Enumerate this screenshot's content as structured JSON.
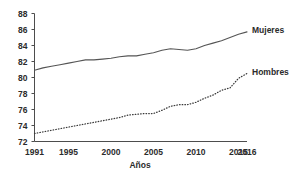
{
  "chart_data": {
    "type": "line",
    "title": "",
    "subtitle": "",
    "xlabel": "Años",
    "ylabel": "",
    "xlim": [
      1991,
      2016
    ],
    "ylim": [
      72,
      88
    ],
    "grid": false,
    "legend_position": "right-inline",
    "x_tick_labels": [
      "1991",
      "1995",
      "2000",
      "2005",
      "2010",
      "2015",
      "2016"
    ],
    "x_tick_values": [
      1991,
      1995,
      2000,
      2005,
      2010,
      2015,
      2016
    ],
    "y_tick_labels": [
      "72",
      "74",
      "76",
      "78",
      "80",
      "82",
      "84",
      "86",
      "88"
    ],
    "y_tick_values": [
      72,
      74,
      76,
      78,
      80,
      82,
      84,
      86,
      88
    ],
    "x": [
      1991,
      1992,
      1993,
      1994,
      1995,
      1996,
      1997,
      1998,
      1999,
      2000,
      2001,
      2002,
      2003,
      2004,
      2005,
      2006,
      2007,
      2008,
      2009,
      2010,
      2011,
      2012,
      2013,
      2014,
      2015,
      2016
    ],
    "series": [
      {
        "name": "Mujeres",
        "style": "solid",
        "color": "#555555",
        "values": [
          80.9,
          81.2,
          81.4,
          81.6,
          81.8,
          82.0,
          82.2,
          82.2,
          82.3,
          82.4,
          82.6,
          82.7,
          82.7,
          82.9,
          83.1,
          83.4,
          83.6,
          83.5,
          83.4,
          83.6,
          84.0,
          84.3,
          84.6,
          85.0,
          85.4,
          85.7
        ]
      },
      {
        "name": "Hombres",
        "style": "dotted",
        "color": "#3a3a3a",
        "values": [
          73.0,
          73.2,
          73.4,
          73.6,
          73.8,
          74.0,
          74.2,
          74.4,
          74.6,
          74.8,
          75.0,
          75.3,
          75.4,
          75.5,
          75.5,
          75.9,
          76.4,
          76.6,
          76.6,
          76.9,
          77.4,
          77.8,
          78.4,
          78.7,
          79.9,
          80.5
        ]
      }
    ],
    "annotations": [
      {
        "text": "Mujeres",
        "x": 2016,
        "y": 85.9
      },
      {
        "text": "Hombres",
        "x": 2016,
        "y": 80.7
      }
    ]
  }
}
